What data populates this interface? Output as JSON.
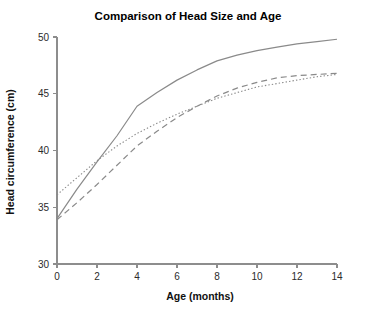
{
  "chart_data": {
    "type": "line",
    "title": "Comparison of Head Size and Age",
    "xlabel": "Age (months)",
    "ylabel": "Head circumference (cm)",
    "xlim": [
      0,
      14
    ],
    "ylim": [
      30,
      50
    ],
    "xticks": [
      0,
      2,
      4,
      6,
      8,
      10,
      12,
      14
    ],
    "yticks": [
      30,
      35,
      40,
      45,
      50
    ],
    "grid": false,
    "legend": "none",
    "x": [
      0,
      1,
      2,
      3,
      4,
      5,
      6,
      7,
      8,
      9,
      10,
      11,
      12,
      13,
      14
    ],
    "series": [
      {
        "name": "series-solid",
        "style": "solid",
        "color": "#8a8a8a",
        "values": [
          34.0,
          36.6,
          39.0,
          41.3,
          43.9,
          45.1,
          46.2,
          47.1,
          47.9,
          48.4,
          48.8,
          49.1,
          49.4,
          49.6,
          49.8
        ]
      },
      {
        "name": "series-dashed",
        "style": "dashed",
        "color": "#8a8a8a",
        "values": [
          33.9,
          35.4,
          37.0,
          38.7,
          40.4,
          41.7,
          42.9,
          43.9,
          44.8,
          45.5,
          46.0,
          46.4,
          46.6,
          46.7,
          46.8
        ]
      },
      {
        "name": "series-dotted",
        "style": "dotted",
        "color": "#8a8a8a",
        "values": [
          36.1,
          37.6,
          39.1,
          40.4,
          41.5,
          42.4,
          43.2,
          43.9,
          44.6,
          45.1,
          45.6,
          45.9,
          46.2,
          46.5,
          46.7
        ]
      }
    ]
  }
}
